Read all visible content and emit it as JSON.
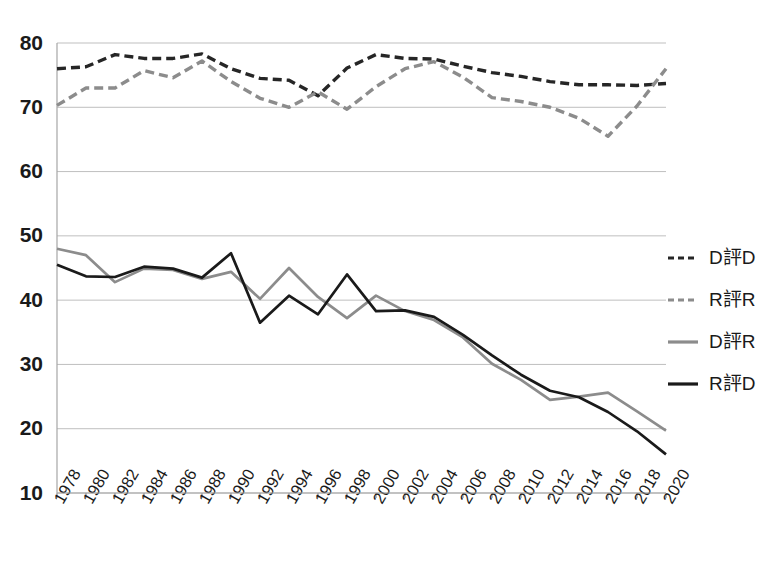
{
  "chart_data": {
    "type": "line",
    "title": "",
    "xlabel": "",
    "ylabel": "",
    "ylim": [
      10,
      80
    ],
    "y_ticks": [
      10,
      20,
      30,
      40,
      50,
      60,
      70,
      80
    ],
    "grid": true,
    "legend_position": "right",
    "categories": [
      "1978",
      "1980",
      "1982",
      "1984",
      "1986",
      "1988",
      "1990",
      "1992",
      "1994",
      "1996",
      "1998",
      "2000",
      "2002",
      "2004",
      "2006",
      "2008",
      "2010",
      "2012",
      "2014",
      "2016",
      "2018",
      "2020"
    ],
    "series": [
      {
        "name": "D評D",
        "style": "dashed",
        "color": "#262626",
        "values": [
          76.0,
          76.3,
          78.2,
          77.6,
          77.6,
          78.3,
          76.0,
          74.5,
          74.2,
          71.8,
          76.1,
          78.2,
          77.6,
          77.5,
          76.4,
          75.4,
          74.8,
          74.0,
          73.5,
          73.5,
          73.4,
          73.7
        ]
      },
      {
        "name": "R評R",
        "style": "dashed",
        "color": "#8c8c8c",
        "values": [
          70.3,
          73.0,
          73.0,
          75.7,
          74.6,
          77.2,
          74.0,
          71.4,
          70.0,
          72.4,
          69.7,
          73.2,
          76.0,
          77.1,
          74.7,
          71.5,
          70.9,
          70.0,
          68.3,
          65.5,
          70.2,
          76.0
        ]
      },
      {
        "name": "D評R",
        "style": "solid",
        "color": "#8c8c8c",
        "values": [
          48.0,
          47.0,
          42.8,
          44.9,
          44.7,
          43.3,
          44.4,
          40.2,
          45.0,
          40.5,
          37.2,
          40.7,
          38.3,
          36.9,
          34.2,
          30.1,
          27.6,
          24.5,
          25.0,
          25.6,
          22.7,
          19.7
        ]
      },
      {
        "name": "R評D",
        "style": "solid",
        "color": "#1a1a1a",
        "values": [
          45.5,
          43.7,
          43.6,
          45.2,
          44.9,
          43.5,
          47.3,
          36.5,
          40.7,
          37.8,
          44.0,
          38.3,
          38.4,
          37.4,
          34.6,
          31.4,
          28.4,
          25.9,
          24.9,
          22.6,
          19.6,
          16.0
        ]
      }
    ],
    "legend": [
      {
        "label": "D評D",
        "style": "dashed",
        "color": "#262626"
      },
      {
        "label": "R評R",
        "style": "dashed",
        "color": "#8c8c8c"
      },
      {
        "label": "D評R",
        "style": "solid",
        "color": "#8c8c8c"
      },
      {
        "label": "R評D",
        "style": "solid",
        "color": "#1a1a1a"
      }
    ]
  },
  "axes": {
    "y_tick_labels": [
      "80",
      "70",
      "60",
      "50",
      "40",
      "30",
      "20",
      "10"
    ],
    "x_tick_labels": [
      "1978",
      "1980",
      "1982",
      "1984",
      "1986",
      "1988",
      "1990",
      "1992",
      "1994",
      "1996",
      "1998",
      "2000",
      "2002",
      "2004",
      "2006",
      "2008",
      "2010",
      "2012",
      "2014",
      "2016",
      "2018",
      "2020"
    ]
  },
  "colors": {
    "grid": "#bfbfbf",
    "axis": "#a6a6a6",
    "dark_series": "#1a1a1a",
    "gray_series": "#8c8c8c",
    "text": "#1a1a1a",
    "background": "#ffffff"
  }
}
